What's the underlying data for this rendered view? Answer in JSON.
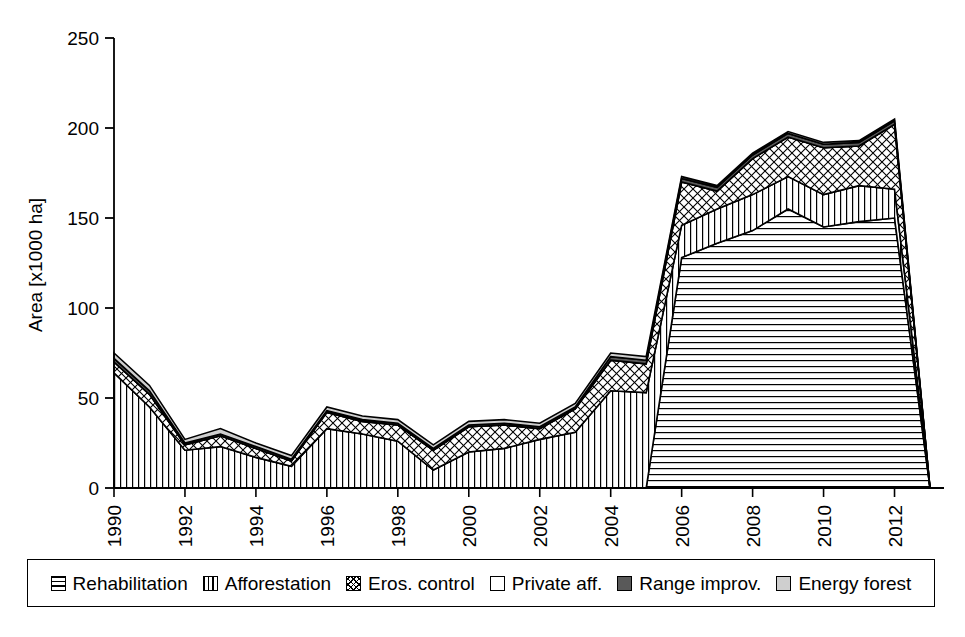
{
  "chart_data": {
    "type": "area",
    "stacked": true,
    "title": "",
    "xlabel": "",
    "ylabel": "Area [x1000 ha]",
    "ylim": [
      0,
      250
    ],
    "ytick_labels": [
      "0",
      "50",
      "100",
      "150",
      "200",
      "250"
    ],
    "yticks": [
      0,
      50,
      100,
      150,
      200,
      250
    ],
    "xtick_labels": [
      "1990",
      "1992",
      "1994",
      "1996",
      "1998",
      "2000",
      "2002",
      "2004",
      "2006",
      "2008",
      "2010",
      "2012"
    ],
    "xticks": [
      1990,
      1992,
      1994,
      1996,
      1998,
      2000,
      2002,
      2004,
      2006,
      2008,
      2010,
      2012
    ],
    "x": [
      1990,
      1991,
      1992,
      1993,
      1994,
      1995,
      1996,
      1997,
      1998,
      1999,
      2000,
      2001,
      2002,
      2003,
      2004,
      2005,
      2006,
      2007,
      2008,
      2009,
      2010,
      2011,
      2012,
      2013
    ],
    "grid": false,
    "legend_position": "bottom",
    "series": [
      {
        "name": "Rehabilitation",
        "pattern": "horizontal-lines",
        "values": [
          0,
          0,
          0,
          0,
          0,
          0,
          0,
          0,
          0,
          0,
          0,
          0,
          0,
          0,
          0,
          0,
          128,
          136,
          143,
          155,
          145,
          148,
          150,
          0
        ]
      },
      {
        "name": "Afforestation",
        "pattern": "vertical-lines",
        "values": [
          64,
          45,
          21,
          23,
          17,
          12,
          33,
          30,
          26,
          10,
          20,
          22,
          27,
          31,
          54,
          53,
          18,
          19,
          20,
          18,
          18,
          20,
          16,
          0
        ]
      },
      {
        "name": "Eros. control",
        "pattern": "crosshatch",
        "values": [
          6,
          7,
          3,
          6,
          5,
          3,
          9,
          7,
          9,
          11,
          14,
          13,
          6,
          13,
          17,
          16,
          24,
          10,
          20,
          22,
          26,
          22,
          36,
          0
        ]
      },
      {
        "name": "Private aff.",
        "pattern": "white",
        "values": [
          0,
          0,
          0,
          0,
          0,
          0,
          0,
          0,
          0,
          0,
          0,
          0,
          0,
          0,
          0,
          0,
          0,
          0,
          0,
          0,
          0,
          0,
          0,
          0
        ]
      },
      {
        "name": "Range improv.",
        "pattern": "dark-gray",
        "values": [
          2,
          2,
          1,
          1,
          1,
          1,
          1,
          1,
          1,
          1,
          1,
          1,
          1,
          1,
          2,
          2,
          2,
          2,
          2,
          2,
          2,
          2,
          2,
          0
        ]
      },
      {
        "name": "Energy forest",
        "pattern": "light-gray",
        "values": [
          3,
          3,
          2,
          3,
          2,
          2,
          2,
          2,
          2,
          2,
          2,
          2,
          2,
          2,
          2,
          2,
          1,
          1,
          1,
          1,
          1,
          1,
          1,
          0
        ]
      }
    ],
    "totals": [
      75,
      57,
      27,
      33,
      25,
      18,
      45,
      40,
      38,
      24,
      37,
      38,
      36,
      47,
      75,
      73,
      173,
      168,
      186,
      198,
      192,
      193,
      205,
      0
    ]
  },
  "legend": {
    "items": [
      {
        "label": "Rehabilitation",
        "swatch": "horizontal-lines-swatch"
      },
      {
        "label": "Afforestation",
        "swatch": "vertical-lines-swatch"
      },
      {
        "label": "Eros. control",
        "swatch": "crosshatch-swatch"
      },
      {
        "label": "Private aff.",
        "swatch": "white-swatch"
      },
      {
        "label": "Range improv.",
        "swatch": "dark-gray-swatch"
      },
      {
        "label": "Energy forest",
        "swatch": "light-gray-swatch"
      }
    ]
  },
  "colors": {
    "axis": "#000000",
    "background": "#ffffff",
    "range_improv": "#595959",
    "energy_forest": "#cfcfcf"
  }
}
